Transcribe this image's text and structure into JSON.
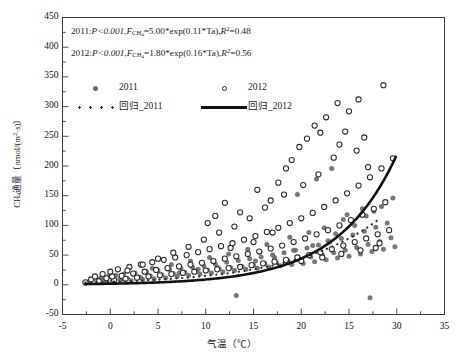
{
  "chart_data": {
    "type": "scatter",
    "title": "",
    "xlabel": "气温（℃）",
    "ylabel": "CH4通量〔nmol/(m2·s)〕",
    "xlim": [
      -5,
      35
    ],
    "ylim": [
      -50,
      450
    ],
    "xticks": [
      -5,
      0,
      5,
      10,
      15,
      20,
      25,
      30,
      35
    ],
    "xtick_labels": [
      "-5",
      "0",
      "5",
      "10",
      "15",
      "20",
      "15",
      "30",
      "35"
    ],
    "yticks": [
      -50,
      0,
      50,
      100,
      150,
      200,
      250,
      300,
      350,
      400,
      450
    ],
    "ytick_labels": [
      "-50",
      "0",
      "50",
      "100",
      "150",
      "200",
      "250",
      "300",
      "350",
      "400",
      "450"
    ],
    "x_minor_step": 2.5,
    "y_minor_step": 25,
    "grid": false,
    "legend_position": "upper-left",
    "annotations": [
      {
        "id": "eq-2011",
        "year": "2011",
        "p": "P<0.001",
        "formula": "FCH4=5.00*exp(0.11*Ta)",
        "r2": "R2=0.48"
      },
      {
        "id": "eq-2012",
        "year": "2012",
        "p": "P<0.001",
        "formula": "FCH4=1.80*exp(0.16*Ta)",
        "r2": "R2=0.56"
      }
    ],
    "series": [
      {
        "name": "2011",
        "marker": "filled-circle",
        "color": "#6b6b6b",
        "points": [
          [
            -2.2,
            6
          ],
          [
            -1.8,
            10
          ],
          [
            -1.4,
            4
          ],
          [
            -1.0,
            12
          ],
          [
            -0.6,
            8
          ],
          [
            -0.2,
            14
          ],
          [
            0.2,
            6
          ],
          [
            0.6,
            16
          ],
          [
            1.0,
            9
          ],
          [
            1.4,
            18
          ],
          [
            1.8,
            11
          ],
          [
            2.2,
            7
          ],
          [
            2.6,
            20
          ],
          [
            3.0,
            13
          ],
          [
            3.4,
            9
          ],
          [
            3.8,
            22
          ],
          [
            4.2,
            15
          ],
          [
            4.6,
            10
          ],
          [
            5.0,
            24
          ],
          [
            5.4,
            17
          ],
          [
            5.8,
            12
          ],
          [
            6.2,
            26
          ],
          [
            6.6,
            19
          ],
          [
            7.0,
            14
          ],
          [
            7.4,
            28
          ],
          [
            7.8,
            21
          ],
          [
            8.2,
            16
          ],
          [
            8.6,
            30
          ],
          [
            9.0,
            23
          ],
          [
            9.4,
            18
          ],
          [
            9.8,
            32
          ],
          [
            10.2,
            25
          ],
          [
            10.6,
            20
          ],
          [
            11.0,
            35
          ],
          [
            11.4,
            27
          ],
          [
            11.8,
            22
          ],
          [
            12.2,
            38
          ],
          [
            12.6,
            29
          ],
          [
            13.0,
            24
          ],
          [
            13.4,
            41
          ],
          [
            13.8,
            31
          ],
          [
            14.2,
            26
          ],
          [
            14.6,
            44
          ],
          [
            15.0,
            33
          ],
          [
            15.4,
            28
          ],
          [
            15.8,
            47
          ],
          [
            16.2,
            36
          ],
          [
            16.6,
            30
          ],
          [
            17.0,
            50
          ],
          [
            17.4,
            38
          ],
          [
            17.8,
            32
          ],
          [
            18.2,
            54
          ],
          [
            18.6,
            41
          ],
          [
            19.0,
            34
          ],
          [
            19.4,
            58
          ],
          [
            19.8,
            44
          ],
          [
            20.2,
            36
          ],
          [
            20.6,
            62
          ],
          [
            21.0,
            47
          ],
          [
            21.4,
            39
          ],
          [
            21.8,
            67
          ],
          [
            22.2,
            50
          ],
          [
            22.6,
            42
          ],
          [
            23.0,
            72
          ],
          [
            23.4,
            54
          ],
          [
            23.8,
            45
          ],
          [
            24.2,
            78
          ],
          [
            24.6,
            58
          ],
          [
            25.0,
            48
          ],
          [
            25.4,
            84
          ],
          [
            25.8,
            63
          ],
          [
            26.2,
            52
          ],
          [
            26.6,
            90
          ],
          [
            27.0,
            68
          ],
          [
            27.4,
            56
          ],
          [
            27.8,
            97
          ],
          [
            28.2,
            73
          ],
          [
            28.6,
            60
          ],
          [
            29.0,
            104
          ],
          [
            29.4,
            79
          ],
          [
            29.8,
            64
          ],
          [
            13.2,
            -18
          ],
          [
            19.6,
            152
          ],
          [
            21.6,
            178
          ],
          [
            23.2,
            196
          ],
          [
            24.8,
            118
          ],
          [
            26.4,
            128
          ],
          [
            28.8,
            138
          ],
          [
            29.6,
            146
          ],
          [
            27.2,
            -22
          ],
          [
            22.4,
            96
          ],
          [
            20.8,
            88
          ],
          [
            18.8,
            80
          ],
          [
            16.4,
            68
          ],
          [
            14.4,
            60
          ],
          [
            12.4,
            52
          ],
          [
            10.4,
            46
          ],
          [
            8.4,
            40
          ],
          [
            6.4,
            34
          ],
          [
            4.4,
            28
          ],
          [
            24.4,
            110
          ],
          [
            25.6,
            100
          ],
          [
            26.8,
            116
          ],
          [
            27.6,
            124
          ],
          [
            28.4,
            132
          ],
          [
            29.2,
            92
          ],
          [
            23.6,
            86
          ],
          [
            22.8,
            74
          ],
          [
            21.2,
            66
          ],
          [
            19.2,
            58
          ],
          [
            17.2,
            46
          ],
          [
            15.2,
            40
          ],
          [
            11.2,
            30
          ],
          [
            9.2,
            26
          ],
          [
            7.2,
            20
          ],
          [
            5.2,
            16
          ],
          [
            3.2,
            12
          ],
          [
            1.2,
            8
          ],
          [
            -0.4,
            5
          ]
        ]
      },
      {
        "name": "2012",
        "marker": "open-circle",
        "color": "#2b2b2b",
        "points": [
          [
            -2.6,
            4
          ],
          [
            -2.0,
            9
          ],
          [
            -1.6,
            14
          ],
          [
            -1.2,
            6
          ],
          [
            -0.8,
            18
          ],
          [
            -0.4,
            11
          ],
          [
            0.0,
            22
          ],
          [
            0.4,
            8
          ],
          [
            0.8,
            26
          ],
          [
            1.2,
            15
          ],
          [
            1.6,
            10
          ],
          [
            2.0,
            30
          ],
          [
            2.4,
            19
          ],
          [
            2.8,
            12
          ],
          [
            3.2,
            34
          ],
          [
            3.6,
            22
          ],
          [
            4.0,
            14
          ],
          [
            4.4,
            38
          ],
          [
            4.8,
            25
          ],
          [
            5.2,
            16
          ],
          [
            5.6,
            42
          ],
          [
            6.0,
            28
          ],
          [
            6.4,
            18
          ],
          [
            6.8,
            46
          ],
          [
            7.2,
            31
          ],
          [
            7.6,
            20
          ],
          [
            8.0,
            50
          ],
          [
            8.4,
            34
          ],
          [
            8.8,
            22
          ],
          [
            9.2,
            55
          ],
          [
            9.6,
            37
          ],
          [
            10.0,
            24
          ],
          [
            10.4,
            60
          ],
          [
            10.8,
            40
          ],
          [
            11.2,
            26
          ],
          [
            11.6,
            65
          ],
          [
            12.0,
            44
          ],
          [
            12.4,
            28
          ],
          [
            12.8,
            70
          ],
          [
            13.2,
            48
          ],
          [
            13.6,
            30
          ],
          [
            14.0,
            76
          ],
          [
            14.4,
            52
          ],
          [
            14.8,
            33
          ],
          [
            15.2,
            82
          ],
          [
            15.6,
            56
          ],
          [
            16.0,
            36
          ],
          [
            16.4,
            89
          ],
          [
            16.8,
            61
          ],
          [
            17.2,
            39
          ],
          [
            17.6,
            96
          ],
          [
            18.0,
            66
          ],
          [
            18.4,
            42
          ],
          [
            18.8,
            104
          ],
          [
            19.2,
            72
          ],
          [
            19.6,
            46
          ],
          [
            20.0,
            112
          ],
          [
            20.4,
            78
          ],
          [
            20.8,
            50
          ],
          [
            21.2,
            121
          ],
          [
            21.6,
            85
          ],
          [
            22.0,
            55
          ],
          [
            22.4,
            131
          ],
          [
            22.8,
            92
          ],
          [
            23.2,
            60
          ],
          [
            23.6,
            142
          ],
          [
            24.0,
            100
          ],
          [
            24.4,
            66
          ],
          [
            24.8,
            154
          ],
          [
            25.2,
            109
          ],
          [
            25.6,
            72
          ],
          [
            26.0,
            167
          ],
          [
            26.4,
            118
          ],
          [
            26.8,
            78
          ],
          [
            27.2,
            181
          ],
          [
            27.6,
            128
          ],
          [
            28.0,
            85
          ],
          [
            28.4,
            196
          ],
          [
            28.8,
            139
          ],
          [
            29.2,
            92
          ],
          [
            29.6,
            213
          ],
          [
            12.0,
            138
          ],
          [
            13.6,
            122
          ],
          [
            15.4,
            160
          ],
          [
            16.8,
            142
          ],
          [
            17.6,
            172
          ],
          [
            18.4,
            196
          ],
          [
            19.0,
            210
          ],
          [
            19.8,
            232
          ],
          [
            20.6,
            246
          ],
          [
            21.4,
            268
          ],
          [
            22.0,
            256
          ],
          [
            22.6,
            282
          ],
          [
            23.4,
            214
          ],
          [
            24.0,
            236
          ],
          [
            24.6,
            258
          ],
          [
            25.0,
            292
          ],
          [
            25.8,
            226
          ],
          [
            26.6,
            248
          ],
          [
            23.8,
            306
          ],
          [
            26.0,
            312
          ],
          [
            28.6,
            336
          ],
          [
            27.0,
            198
          ],
          [
            21.8,
            186
          ],
          [
            20.2,
            168
          ],
          [
            18.2,
            152
          ],
          [
            16.2,
            130
          ],
          [
            14.6,
            112
          ],
          [
            13.0,
            98
          ],
          [
            11.4,
            88
          ],
          [
            9.8,
            76
          ],
          [
            8.2,
            64
          ],
          [
            6.6,
            54
          ],
          [
            5.0,
            44
          ],
          [
            3.4,
            34
          ],
          [
            1.8,
            24
          ],
          [
            0.2,
            14
          ],
          [
            27.8,
            62
          ],
          [
            28.2,
            70
          ],
          [
            26.2,
            58
          ],
          [
            24.2,
            52
          ],
          [
            22.2,
            46
          ],
          [
            20.0,
            40
          ],
          [
            17.0,
            88
          ],
          [
            15.0,
            72
          ],
          [
            12.6,
            62
          ],
          [
            10.2,
            104
          ],
          [
            11.0,
            116
          ]
        ]
      }
    ],
    "fits": [
      {
        "name": "回归_2011",
        "style": "dashed",
        "color": "#2b2b2b",
        "a": 5.0,
        "b": 0.11,
        "x_start": -2.6,
        "x_end": 28.3
      },
      {
        "name": "回归_2012",
        "style": "solid",
        "color": "#111111",
        "a": 1.8,
        "b": 0.16,
        "x_start": -2.6,
        "x_end": 29.9
      }
    ],
    "legend": [
      {
        "label": "2011",
        "key": "filled-circle"
      },
      {
        "label": "2012",
        "key": "open-circle"
      },
      {
        "label": "回归_2011",
        "key": "dashed-line"
      },
      {
        "label": "回归_2012",
        "key": "solid-line"
      }
    ]
  },
  "axis_titles": {
    "y_prefix": "CH",
    "y_sub": "4",
    "y_rest": "通量〔nmol/(m",
    "y_sup": "2",
    "y_tail": "·s)〕",
    "x": "气温（℃）"
  },
  "equations": {
    "line1": {
      "year": "2011",
      "p": "P<0.001",
      "f": "F",
      "f_sub": "CH",
      "f_sub2": "4",
      "body": "=5.00*exp(0.11*Ta),",
      "r": "R",
      "r_sup": "2",
      "r_val": "=0.48"
    },
    "line2": {
      "year": "2012",
      "p": "P<0.001",
      "f": "F",
      "f_sub": "CH",
      "f_sub2": "4",
      "body": "=1.80*exp(0.16*Ta),",
      "r": "R",
      "r_sup": "2",
      "r_val": "=0.56"
    }
  },
  "legend_labels": {
    "s2011": "2011",
    "s2012": "2012",
    "fit2011": "回归_2011",
    "fit2012": "回归_2012"
  },
  "caption": ""
}
